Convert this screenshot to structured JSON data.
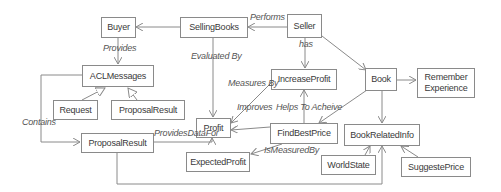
{
  "diagram": {
    "nodes": {
      "buyer": "Buyer",
      "selling_books": "SellingBooks",
      "seller": "Seller",
      "acl_messages": "ACLMessages",
      "request": "Request",
      "proposal_result_top": "ProposalResult",
      "profit": "Profit",
      "increase_profit": "IncreaseProfit",
      "book": "Book",
      "remember_experience": "Remember Experience",
      "find_best_price": "FindBestPrice",
      "book_related_info": "BookRelatedInfo",
      "proposal_result_bottom": "ProposalResult",
      "expected_profit": "ExpectedProfit",
      "world_state": "WorldState",
      "suggeste_price": "SuggestePrice"
    },
    "edge_labels": {
      "performs": "Performs",
      "has": "has",
      "provides": "Provides",
      "evaluated_by": "Evaluated By",
      "measures_by": "Measures By",
      "improves": "Improves",
      "helps_to_acheive": "Helps To Acheive",
      "contains": "Contains",
      "provides_data_for": "ProvidesDataFor",
      "is_measured_by": "IsMeasuredBy"
    },
    "colors": {
      "line": "#8a8a8a",
      "text": "#3a3a3a",
      "label": "#555555"
    }
  }
}
